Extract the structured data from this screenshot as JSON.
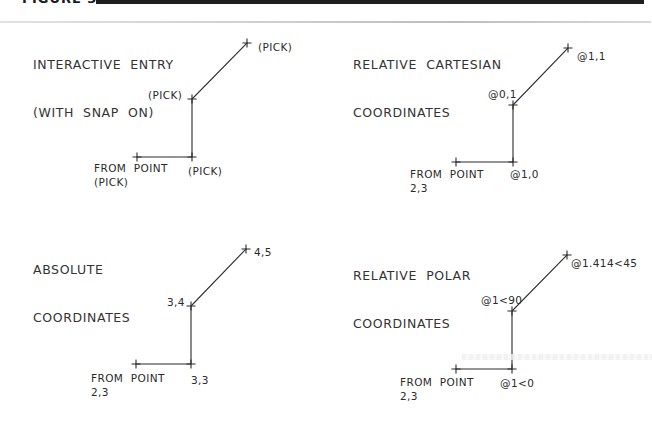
{
  "figure": {
    "label": "FIGURE 3-6",
    "colors": {
      "ink": "#2a2a2a",
      "bar": "#1e1e1e",
      "rule": "#c8c8c8",
      "background": "#ffffff"
    }
  },
  "panels": [
    {
      "id": "interactive-entry",
      "title_line1": "INTERACTIVE  ENTRY",
      "title_line2": "(WITH  SNAP  ON)",
      "from_label_line1": "FROM  POINT",
      "from_label_line2": "(PICK)",
      "corner_label": "(PICK)",
      "mid_label": "(PICK)",
      "end_label": "(PICK)",
      "points": {
        "start": [
          137,
          157
        ],
        "corner": [
          192,
          157
        ],
        "mid": [
          192,
          99
        ],
        "end": [
          247,
          43
        ]
      }
    },
    {
      "id": "relative-cartesian",
      "title_line1": "RELATIVE  CARTESIAN",
      "title_line2": "COORDINATES",
      "from_label_line1": "FROM  POINT",
      "from_label_line2": "2,3",
      "corner_label": "@1,0",
      "mid_label": "@0,1",
      "end_label": "@1,1",
      "points": {
        "start": [
          456,
          162
        ],
        "corner": [
          513,
          162
        ],
        "mid": [
          513,
          105
        ],
        "end": [
          568,
          48
        ]
      }
    },
    {
      "id": "absolute-coordinates",
      "title_line1": "ABSOLUTE",
      "title_line2": "COORDINATES",
      "from_label_line1": "FROM  POINT",
      "from_label_line2": "2,3",
      "corner_label": "3,3",
      "mid_label": "3,4",
      "end_label": "4,5",
      "points": {
        "start": [
          136,
          364
        ],
        "corner": [
          191,
          364
        ],
        "mid": [
          191,
          306
        ],
        "end": [
          246,
          249
        ]
      }
    },
    {
      "id": "relative-polar",
      "title_line1": "RELATIVE  POLAR",
      "title_line2": "COORDINATES",
      "from_label_line1": "FROM  POINT",
      "from_label_line2": "2,3",
      "corner_label": "@1<0",
      "mid_label": "@1<90",
      "end_label": "@1.414<45",
      "points": {
        "start": [
          456,
          369
        ],
        "corner": [
          512,
          369
        ],
        "mid": [
          512,
          311
        ],
        "end": [
          567,
          255
        ]
      }
    }
  ]
}
